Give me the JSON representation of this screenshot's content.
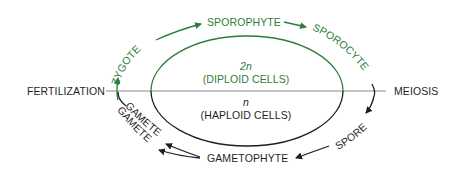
{
  "colors": {
    "diploid": "#2e7d3a",
    "haploid": "#1f1f1f",
    "divider": "#8a8a8a",
    "background": "#ffffff"
  },
  "divider": {
    "left_label": "FERTILIZATION",
    "right_label": "MEIOSIS"
  },
  "center": {
    "diploid_ploidy": "2n",
    "diploid_label": "(DIPLOID CELLS)",
    "haploid_ploidy": "n",
    "haploid_label": "(HAPLOID CELLS)"
  },
  "cycle": {
    "diploid_stages": [
      "ZYGOTE",
      "SPOROPHYTE",
      "SPOROCYTE"
    ],
    "haploid_stages": [
      "SPORE",
      "GAMETOPHYTE",
      "GAMETE",
      "GAMETE"
    ]
  }
}
